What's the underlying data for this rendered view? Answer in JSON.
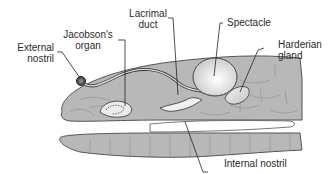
{
  "diagram": {
    "labels": {
      "external_nostril": [
        "External",
        "nostril"
      ],
      "jacobsons_organ": [
        "Jacobson's",
        "organ"
      ],
      "lacrimal_duct": [
        "Lacrimal",
        "duct"
      ],
      "spectacle": "Spectacle",
      "harderian_gland": [
        "Harderian",
        "gland"
      ],
      "internal_nostril": "Internal nostril"
    },
    "colors": {
      "skin": "#b8b8b8",
      "scale_lines": "#8c8c8c",
      "outline": "#555555",
      "organ_light": "#e6e6e6",
      "mouth": "#ffffff"
    }
  }
}
